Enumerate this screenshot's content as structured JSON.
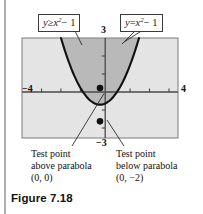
{
  "figure": {
    "caption": "Figure 7.18",
    "callouts": {
      "left": {
        "lhs": "y",
        "op": "≥",
        "base": "x",
        "exp": "2",
        "tail": "− 1",
        "full": "y ≥ x² − 1"
      },
      "right": {
        "lhs": "y",
        "op": "=",
        "base": "x",
        "exp": "2",
        "tail": "− 1",
        "full": "y = x² − 1"
      }
    },
    "axis_labels": {
      "y_top": "3",
      "y_bottom": "−3",
      "x_left": "−4",
      "x_right": "4"
    },
    "annotations": {
      "left": {
        "line1": "Test point",
        "line2": "above parabola",
        "line3": "(0, 0)"
      },
      "right": {
        "line1": "Test point",
        "line2": "below parabola",
        "line3": "(0, −2)"
      }
    },
    "colors": {
      "region_solution": "#b9b9b9",
      "region_other": "#e4e4e4",
      "curve": "#111111",
      "axis": "#5a5a5a",
      "frame": "#8e8e8e",
      "page_rule": "#b0b0b0",
      "point": "#111111"
    }
  },
  "chart_data": {
    "type": "line",
    "title": "Figure 7.18",
    "equation": "y = x^2 - 1",
    "inequality": "y >= x^2 - 1",
    "xlabel": "",
    "ylabel": "",
    "xlim": [
      -4,
      4
    ],
    "ylim": [
      -3,
      3
    ],
    "xticks": [
      -4,
      -3,
      -2,
      -1,
      0,
      1,
      2,
      3,
      4
    ],
    "yticks": [
      -3,
      -2,
      -1,
      0,
      1,
      2,
      3
    ],
    "labeled_xticks": [
      "−4",
      "4"
    ],
    "labeled_yticks": [
      "3",
      "−3"
    ],
    "grid": false,
    "legend": "none",
    "series": [
      {
        "name": "y = x^2 - 1",
        "x": [
          -2.0,
          -1.75,
          -1.5,
          -1.25,
          -1.0,
          -0.75,
          -0.5,
          -0.25,
          0.0,
          0.25,
          0.5,
          0.75,
          1.0,
          1.25,
          1.5,
          1.75,
          2.0
        ],
        "y": [
          3.0,
          2.0625,
          1.25,
          0.5625,
          0.0,
          -0.4375,
          -0.75,
          -0.9375,
          -1.0,
          -0.9375,
          -0.75,
          -0.4375,
          0.0,
          0.5625,
          1.25,
          2.0625,
          3.0
        ]
      }
    ],
    "shaded_regions": [
      {
        "name": "solution-region",
        "description": "y >= x^2 - 1 (inside/above parabola)",
        "fill": "#b9b9b9"
      },
      {
        "name": "non-solution-region",
        "description": "y < x^2 - 1 (outside/below parabola)",
        "fill": "#e4e4e4"
      }
    ],
    "points": [
      {
        "label": "Test point above parabola",
        "coords": "(0, 0)",
        "x": 0,
        "y": 0
      },
      {
        "label": "Test point below parabola",
        "coords": "(0, −2)",
        "x": 0,
        "y": -2
      }
    ],
    "annotations": [
      {
        "text": "y ≥ x² − 1",
        "points_to": "solution-region"
      },
      {
        "text": "y = x² − 1",
        "points_to": "curve"
      }
    ]
  }
}
